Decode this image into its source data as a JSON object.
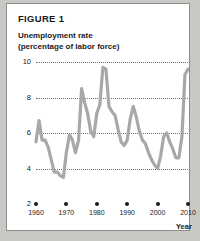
{
  "figure": {
    "label": "FIGURE 1",
    "title_line1": "Unemployment rate",
    "title_line2": "(percentage of labor force)"
  },
  "colors": {
    "line": "#a8a8a8",
    "grid": "#6f6f6f",
    "text": "#1a1a1a",
    "card_background": "#ffffff",
    "card_border": "#8d8d8a",
    "page_background": "#c8c8c4"
  },
  "chart_data": {
    "type": "line",
    "title": "Unemployment rate (percentage of labor force)",
    "xlabel": "Year",
    "ylabel": "",
    "xlim": [
      1960,
      2010
    ],
    "ylim": [
      2,
      10
    ],
    "grid": true,
    "legend": "none",
    "y_ticks": [
      2,
      4,
      6,
      8,
      10
    ],
    "y_gridlines": [
      4,
      6,
      8,
      10
    ],
    "x_ticks": [
      1960,
      1970,
      1980,
      1990,
      2000,
      2010
    ],
    "x": [
      1960,
      1961,
      1962,
      1963,
      1964,
      1965,
      1966,
      1967,
      1968,
      1969,
      1970,
      1971,
      1972,
      1973,
      1974,
      1975,
      1976,
      1977,
      1978,
      1979,
      1980,
      1981,
      1982,
      1983,
      1984,
      1985,
      1986,
      1987,
      1988,
      1989,
      1990,
      1991,
      1992,
      1993,
      1994,
      1995,
      1996,
      1997,
      1998,
      1999,
      2000,
      2001,
      2002,
      2003,
      2004,
      2005,
      2006,
      2007,
      2008,
      2009,
      2010
    ],
    "series": [
      {
        "name": "Unemployment rate",
        "values": [
          5.5,
          6.7,
          5.6,
          5.6,
          5.2,
          4.5,
          3.8,
          3.8,
          3.6,
          3.5,
          4.9,
          5.9,
          5.6,
          4.9,
          5.6,
          8.5,
          7.7,
          7.1,
          6.1,
          5.8,
          7.1,
          7.6,
          9.7,
          9.6,
          7.5,
          7.2,
          7.0,
          6.2,
          5.5,
          5.3,
          5.6,
          6.8,
          7.5,
          6.9,
          6.1,
          5.6,
          5.4,
          4.9,
          4.5,
          4.2,
          4.0,
          4.7,
          5.8,
          6.0,
          5.5,
          5.1,
          4.6,
          4.6,
          5.8,
          9.3,
          9.6
        ]
      }
    ]
  }
}
